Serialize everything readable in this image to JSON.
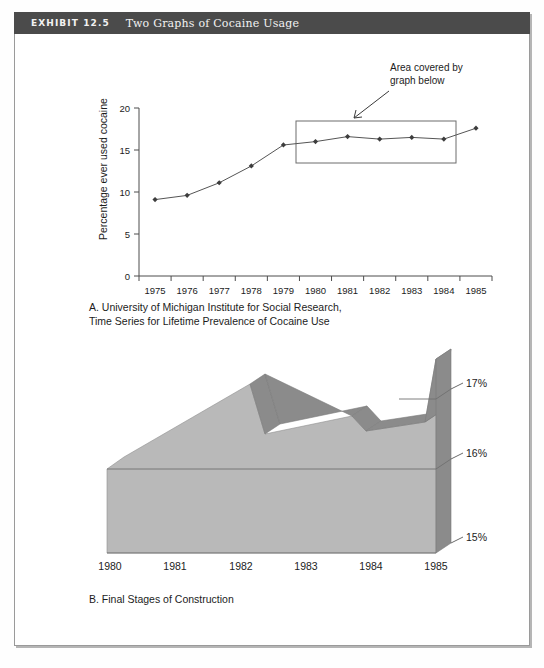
{
  "exhibit": {
    "number_label": "EXHIBIT 12.5",
    "title": "Two Graphs of Cocaine Usage"
  },
  "panel_a": {
    "caption": "A. University of Michigan Institute for Social Research,\nTime Series for Lifetime Prevalence of Cocaine Use",
    "annotation": "Area covered by\ngraph below",
    "annotation_line1": "Area covered by",
    "annotation_line2": "graph below"
  },
  "panel_b": {
    "caption": "B. Final Stages of Construction"
  },
  "colors": {
    "header_bar": "#4b4b4b",
    "frame_border": "#9a9a9a",
    "area_front": "#b9b9b9",
    "area_top_ribbon": "#8b8b8b",
    "area_side": "#8b8b8b",
    "line_stroke": "#555555",
    "text": "#1c1c1c"
  },
  "chart_data": [
    {
      "id": "panel-a-line",
      "type": "line",
      "title": "A. University of Michigan Institute for Social Research, Time Series for Lifetime Prevalence of Cocaine Use",
      "xlabel": "",
      "ylabel": "Percentage ever used cocaine",
      "categories": [
        "1975",
        "1976",
        "1977",
        "1978",
        "1979",
        "1980",
        "1981",
        "1982",
        "1983",
        "1984",
        "1985"
      ],
      "values": [
        9.1,
        9.6,
        11.1,
        13.1,
        15.6,
        16.0,
        16.6,
        16.3,
        16.5,
        16.3,
        17.6
      ],
      "yticks": [
        0,
        5,
        10,
        15,
        20
      ],
      "ylim": [
        0,
        20
      ],
      "ytick_labels": [
        "0",
        "5",
        "10",
        "15",
        "20"
      ],
      "grid": false,
      "legend": "none",
      "markers": "diamond",
      "annotations": [
        {
          "text": "Area covered by graph below",
          "target": "highlight rectangle spanning 1980-1985, ~15.0% to ~18.3%"
        }
      ],
      "highlight_rect": {
        "x_from": "1980",
        "x_to": "1985",
        "y_from": 15.0,
        "y_to": 18.3
      }
    },
    {
      "id": "panel-b-area3d",
      "type": "area",
      "title": "B. Final Stages of Construction",
      "xlabel": "",
      "ylabel": "",
      "categories": [
        "1980",
        "1981",
        "1982",
        "1983",
        "1984",
        "1985"
      ],
      "values": [
        15.95,
        16.6,
        16.1,
        16.25,
        16.05,
        17.6
      ],
      "yticks": [
        15,
        16,
        17
      ],
      "ytick_labels": [
        "15%",
        "16%",
        "17%"
      ],
      "ylim": [
        15,
        17.8
      ],
      "grid": false,
      "legend": "none",
      "note": "3D extruded area chart; right-hand wall carries the percentage scale"
    }
  ]
}
